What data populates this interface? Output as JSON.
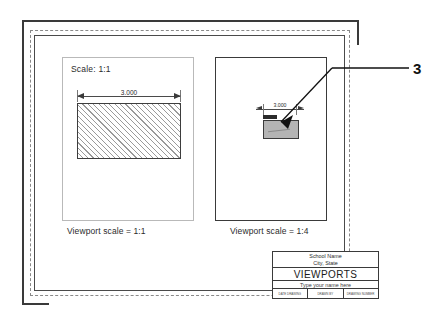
{
  "drawing": {
    "callout": {
      "number": "3"
    },
    "viewport_left": {
      "scale_note": "Scale: 1:1",
      "dimension": "3.000",
      "caption": "Viewport scale = 1:1",
      "border_color": "#b9b9b9",
      "hatch_color": "#9a9a9a"
    },
    "viewport_right": {
      "dimension": "3.000",
      "caption": "Viewport scale = 1:4",
      "border_color": "#3a3a3a",
      "object_fill": "#b4b4b4"
    },
    "title_block": {
      "school_name": "School Name",
      "city_state": "City, State",
      "drawing_title": "VIEWPORTS",
      "name_prompt": "Type your name here",
      "fields": [
        {
          "label": "DATE DRAWING"
        },
        {
          "label": "DRAWN BY"
        },
        {
          "label": "DRAWING NUMBER"
        }
      ]
    },
    "colors": {
      "sheet_border": "#3a3a3a",
      "margin_dashed": "#8a8a8a",
      "printable_border": "#4a4a4a",
      "ink": "#2b2b2b"
    }
  }
}
